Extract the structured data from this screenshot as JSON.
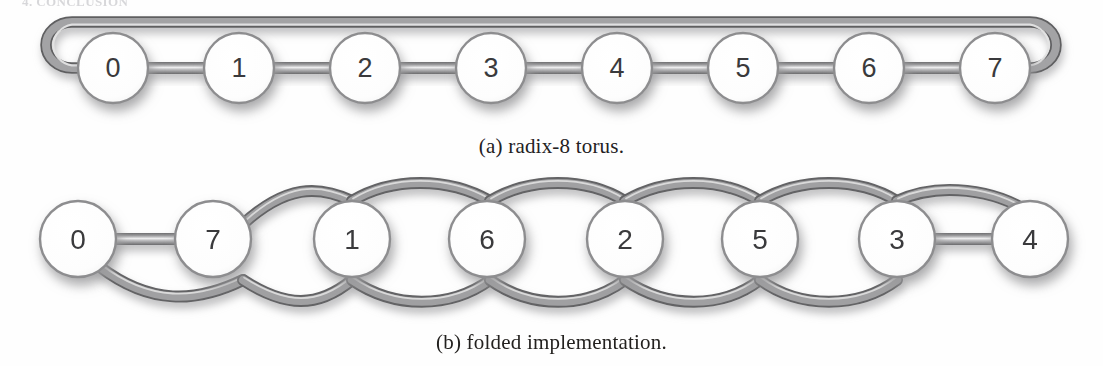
{
  "page": {
    "top_cut_text": "4. CONCLUSION",
    "background_color": "#fefefe"
  },
  "figure": {
    "node_fill": "#ffffff",
    "node_stroke": "#8d8d8f",
    "node_text_color": "#3a3a3c",
    "link_color": "#8a8a8c",
    "link_edge_color": "#5e5e60",
    "link_highlight_color": "#e8e8e8",
    "shadow_color": "#a9a9ab"
  },
  "panels": [
    {
      "id": "a",
      "caption_label": "(a)",
      "caption_text": "radix-8 torus.",
      "caption_full": "(a) radix-8 torus.",
      "topology": "ring",
      "node_radius": 35,
      "node_center_y": 68,
      "wrap_bar_y": 23,
      "nodes": [
        {
          "label": "0",
          "cx": 113
        },
        {
          "label": "1",
          "cx": 239
        },
        {
          "label": "2",
          "cx": 365
        },
        {
          "label": "3",
          "cx": 491
        },
        {
          "label": "4",
          "cx": 617
        },
        {
          "label": "5",
          "cx": 743
        },
        {
          "label": "6",
          "cx": 869
        },
        {
          "label": "7",
          "cx": 995
        }
      ],
      "edges": [
        {
          "from": "0",
          "to": "1",
          "kind": "straight"
        },
        {
          "from": "1",
          "to": "2",
          "kind": "straight"
        },
        {
          "from": "2",
          "to": "3",
          "kind": "straight"
        },
        {
          "from": "3",
          "to": "4",
          "kind": "straight"
        },
        {
          "from": "4",
          "to": "5",
          "kind": "straight"
        },
        {
          "from": "5",
          "to": "6",
          "kind": "straight"
        },
        {
          "from": "6",
          "to": "7",
          "kind": "straight"
        },
        {
          "from": "7",
          "to": "0",
          "kind": "wraparound"
        }
      ]
    },
    {
      "id": "b",
      "caption_label": "(b)",
      "caption_text": "folded implementation.",
      "caption_full": "(b) folded implementation.",
      "topology": "folded-ring",
      "node_radius": 38,
      "node_center_y": 239,
      "curve_top_y": 187,
      "curve_bottom_y": 296,
      "nodes": [
        {
          "label": "0",
          "cx": 78
        },
        {
          "label": "7",
          "cx": 213
        },
        {
          "label": "1",
          "cx": 352
        },
        {
          "label": "6",
          "cx": 487
        },
        {
          "label": "2",
          "cx": 625
        },
        {
          "label": "5",
          "cx": 760
        },
        {
          "label": "3",
          "cx": 897
        },
        {
          "label": "4",
          "cx": 1030
        }
      ],
      "edges": [
        {
          "from": "0",
          "to": "7",
          "kind": "straight"
        },
        {
          "from": "7",
          "to": "1",
          "kind": "arc-over"
        },
        {
          "from": "1",
          "to": "6",
          "kind": "arc-over"
        },
        {
          "from": "6",
          "to": "2",
          "kind": "arc-over"
        },
        {
          "from": "2",
          "to": "5",
          "kind": "arc-over"
        },
        {
          "from": "5",
          "to": "3",
          "kind": "arc-over"
        },
        {
          "from": "3",
          "to": "4",
          "kind": "straight"
        },
        {
          "from": "0",
          "to": "1",
          "kind": "arc-under"
        },
        {
          "from": "7",
          "to": "6",
          "kind": "arc-under"
        },
        {
          "from": "1",
          "to": "2",
          "kind": "arc-under"
        },
        {
          "from": "6",
          "to": "5",
          "kind": "arc-under"
        },
        {
          "from": "2",
          "to": "3",
          "kind": "arc-under"
        },
        {
          "from": "5",
          "to": "4",
          "kind": "arc-under"
        }
      ]
    }
  ]
}
